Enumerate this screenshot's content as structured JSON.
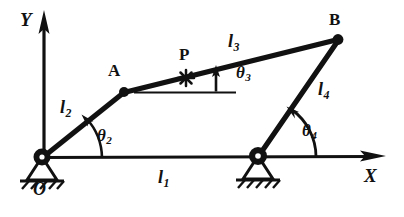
{
  "figure": {
    "colors": {
      "ink": "#111111",
      "background": "#ffffff"
    },
    "axes": {
      "x_label": "X",
      "y_label": "Y",
      "origin_label": "O"
    },
    "points": [
      {
        "id": "O",
        "label": "O",
        "x": 42,
        "y": 158,
        "kind": "ground-pivot"
      },
      {
        "id": "A",
        "label": "A",
        "x": 124,
        "y": 92,
        "kind": "moving-pivot"
      },
      {
        "id": "B",
        "label": "B",
        "x": 338,
        "y": 39,
        "kind": "moving-pivot"
      },
      {
        "id": "B0",
        "label": "",
        "x": 258,
        "y": 157,
        "kind": "ground-pivot"
      },
      {
        "id": "P",
        "label": "P",
        "x": 186,
        "y": 78,
        "kind": "coupler-point"
      }
    ],
    "links": [
      {
        "id": "l1",
        "label": "l",
        "subscript": "1",
        "from": "O",
        "to": "B0",
        "role": "ground-link"
      },
      {
        "id": "l2",
        "label": "l",
        "subscript": "2",
        "from": "O",
        "to": "A",
        "role": "crank"
      },
      {
        "id": "l3",
        "label": "l",
        "subscript": "3",
        "from": "A",
        "to": "B",
        "role": "coupler"
      },
      {
        "id": "l4",
        "label": "l",
        "subscript": "4",
        "from": "B0",
        "to": "B",
        "role": "rocker"
      }
    ],
    "angles": [
      {
        "id": "theta2",
        "label": "θ",
        "subscript": "2",
        "at": "O",
        "degrees": 39
      },
      {
        "id": "theta3",
        "label": "θ",
        "subscript": "3",
        "at": "A",
        "degrees": 14
      },
      {
        "id": "theta4",
        "label": "θ",
        "subscript": "4",
        "at": "B0",
        "degrees": 119
      }
    ],
    "label_positions": {
      "y_axis": {
        "x": 20,
        "y": 10
      },
      "x_axis": {
        "x": 364,
        "y": 166
      },
      "origin": {
        "x": 33,
        "y": 180
      },
      "point_a": {
        "x": 108,
        "y": 62
      },
      "point_b": {
        "x": 329,
        "y": 11
      },
      "point_p": {
        "x": 179,
        "y": 46
      },
      "l1": {
        "x": 158,
        "y": 168
      },
      "l2": {
        "x": 60,
        "y": 98
      },
      "l3": {
        "x": 228,
        "y": 32
      },
      "l4": {
        "x": 318,
        "y": 80
      },
      "theta2": {
        "x": 97,
        "y": 127
      },
      "theta3": {
        "x": 236,
        "y": 64
      },
      "theta4": {
        "x": 302,
        "y": 122
      }
    }
  }
}
